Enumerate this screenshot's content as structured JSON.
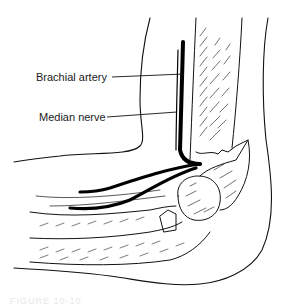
{
  "figure": {
    "labels": [
      {
        "id": "brachial-artery",
        "text": "Brachial artery"
      },
      {
        "id": "median-nerve",
        "text": "Median nerve"
      }
    ],
    "caption": "FIGURE 10-10",
    "colors": {
      "background": "#ffffff",
      "ink": "#111111"
    }
  }
}
